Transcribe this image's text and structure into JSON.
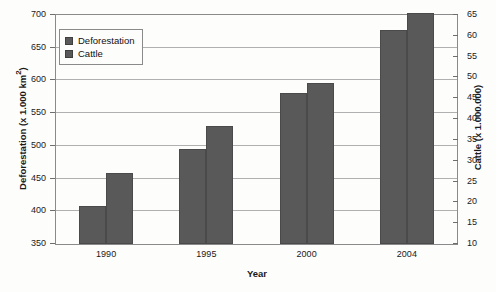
{
  "chart_data": {
    "type": "bar",
    "title": "",
    "xlabel": "Year",
    "categories": [
      "1990",
      "1995",
      "2000",
      "2004"
    ],
    "grid": true,
    "legend_position": "top-left",
    "axes": {
      "left": {
        "label": "Deforestation (x 1.000 km",
        "label_sup": "2",
        "label_suffix": ")",
        "ticks": [
          350,
          400,
          450,
          500,
          550,
          600,
          650,
          700
        ],
        "ylim": [
          350,
          700
        ]
      },
      "right": {
        "label": "Cattle (x 1.000.000)",
        "ticks": [
          10,
          15,
          20,
          25,
          30,
          35,
          40,
          45,
          50,
          55,
          60,
          65
        ],
        "ylim": [
          10,
          65
        ]
      }
    },
    "series": [
      {
        "name": "Deforestation",
        "axis": "left",
        "color": "#595959",
        "values": [
          408,
          495,
          581,
          677
        ]
      },
      {
        "name": "Cattle",
        "axis": "right",
        "color": "#595959",
        "values": [
          25.5,
          36,
          48.5,
          64
        ],
        "values_on_left_scale": [
          458,
          530,
          596,
          703
        ]
      }
    ]
  },
  "legend": {
    "items": [
      {
        "label": "Deforestation"
      },
      {
        "label": "Cattle"
      }
    ]
  }
}
